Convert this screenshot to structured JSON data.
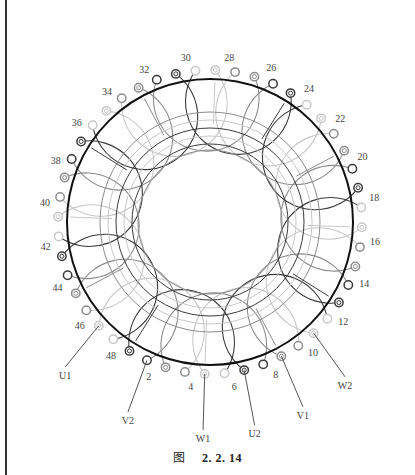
{
  "diagram": {
    "slot_count": 48,
    "numbered_slots": [
      2,
      4,
      6,
      8,
      10,
      12,
      14,
      16,
      18,
      20,
      22,
      24,
      26,
      28,
      30,
      32,
      34,
      36,
      38,
      40,
      42,
      44,
      46,
      48
    ],
    "slot_labels": {
      "2": "2",
      "4": "4",
      "6": "6",
      "8": "8",
      "10": "10",
      "12": "12",
      "14": "14",
      "16": "16",
      "18": "18",
      "20": "20",
      "22": "22",
      "24": "24",
      "26": "26",
      "28": "28",
      "30": "30",
      "32": "32",
      "34": "34",
      "36": "36",
      "38": "38",
      "40": "40",
      "42": "42",
      "44": "44",
      "46": "46",
      "48": "48"
    },
    "leads": [
      {
        "label": "U1",
        "slot": 47
      },
      {
        "label": "V2",
        "slot": 2
      },
      {
        "label": "W1",
        "slot": 5
      },
      {
        "label": "U2",
        "slot": 7
      },
      {
        "label": "V1",
        "slot": 9
      },
      {
        "label": "W2",
        "slot": 11
      }
    ],
    "colors": {
      "main_ring": "#111111",
      "phase_dark": "#3a3a3a",
      "phase_mid": "#8c8c8c",
      "phase_light": "#c8c8c8",
      "label": "#444444"
    }
  },
  "caption": {
    "figure_char": "图",
    "figure_number": "2. 2. 14"
  }
}
